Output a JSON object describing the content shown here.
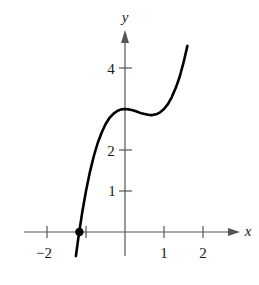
{
  "chart_data": {
    "type": "line",
    "title": "",
    "xlabel": "x",
    "ylabel": "y",
    "function": "f(x) = x^3 - x^2 + 3",
    "x_ticks": [
      -2,
      -1,
      1,
      2
    ],
    "x_tick_labels": [
      "−2",
      "",
      "1",
      "2"
    ],
    "y_ticks": [
      1,
      2,
      3,
      4
    ],
    "y_tick_labels": [
      "1",
      "2",
      "",
      "4"
    ],
    "xlim": [
      -2.6,
      2.9
    ],
    "ylim": [
      -0.6,
      4.9
    ],
    "grid": false,
    "legend": null,
    "series": [
      {
        "name": "f(x)",
        "x": [
          -1.26,
          -1.2,
          -1.1,
          -1.0,
          -0.9,
          -0.8,
          -0.7,
          -0.6,
          -0.5,
          -0.4,
          -0.3,
          -0.2,
          -0.1,
          0.0,
          0.1,
          0.2,
          0.3,
          0.4,
          0.5,
          0.6,
          0.667,
          0.7,
          0.8,
          0.9,
          1.0,
          1.1,
          1.2,
          1.3,
          1.4,
          1.5,
          1.6
        ],
        "values": [
          -0.59,
          -0.17,
          0.46,
          1.0,
          1.46,
          1.85,
          2.17,
          2.42,
          2.63,
          2.78,
          2.88,
          2.95,
          2.99,
          3.0,
          2.99,
          2.97,
          2.94,
          2.9,
          2.88,
          2.86,
          2.85,
          2.85,
          2.87,
          2.92,
          3.0,
          3.12,
          3.29,
          3.51,
          3.78,
          4.13,
          4.54
        ]
      }
    ],
    "annotations": [
      {
        "type": "point",
        "x": -1.17,
        "y": 0,
        "label": "",
        "style": "filled-dot"
      }
    ]
  },
  "axes": {
    "x_label": "x",
    "y_label": "y",
    "x_tick_text": {
      "m2": "−2",
      "p1": "1",
      "p2": "2"
    },
    "y_tick_text": {
      "p1": "1",
      "p2": "2",
      "p4": "4"
    }
  }
}
